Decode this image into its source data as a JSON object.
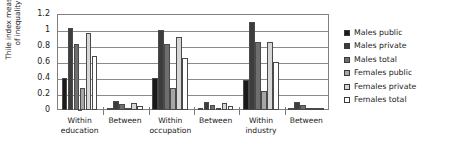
{
  "chart_data": {
    "type": "bar",
    "title": "",
    "xlabel": "",
    "ylabel": "Thile index measure\nof inequality",
    "ylim": [
      0,
      1.2
    ],
    "ytick_labels": [
      "1.2",
      "1",
      "0.8",
      "0.6",
      "0.4",
      "0.2",
      "0"
    ],
    "ytick_values": [
      1.2,
      1,
      0.8,
      0.6,
      0.4,
      0.2,
      0
    ],
    "grid": true,
    "legend_position": "right",
    "categories": [
      "Within\neducation",
      "Between",
      "Within\noccupation",
      "Between",
      "Within\nindustry",
      "Between"
    ],
    "series": [
      {
        "name": "Males public",
        "color": "#1a1a1a",
        "values": [
          0.4,
          0.03,
          0.4,
          0.03,
          0.38,
          0.02
        ]
      },
      {
        "name": "Males private",
        "color": "#3d3d3d",
        "values": [
          1.02,
          0.11,
          1.0,
          0.1,
          1.1,
          0.1
        ]
      },
      {
        "name": "Males total",
        "color": "#6e6e6e",
        "values": [
          0.83,
          0.07,
          0.82,
          0.06,
          0.85,
          0.06
        ]
      },
      {
        "name": "Females public",
        "color": "#a6a6a6",
        "values": [
          0.27,
          0.02,
          0.27,
          0.02,
          0.24,
          0.01
        ]
      },
      {
        "name": "Females private",
        "color": "#d6d6d6",
        "values": [
          0.96,
          0.09,
          0.91,
          0.09,
          0.85,
          0.02
        ]
      },
      {
        "name": "Females total",
        "color": "#ffffff",
        "values": [
          0.67,
          0.05,
          0.65,
          0.05,
          0.6,
          0.02
        ]
      }
    ]
  },
  "legend": {
    "items": [
      {
        "label": "Males public",
        "color": "#1a1a1a"
      },
      {
        "label": "Males private",
        "color": "#3d3d3d"
      },
      {
        "label": "Males total",
        "color": "#6e6e6e"
      },
      {
        "label": "Females public",
        "color": "#a6a6a6"
      },
      {
        "label": "Females private",
        "color": "#d6d6d6"
      },
      {
        "label": "Females total",
        "color": "#ffffff"
      }
    ]
  },
  "axis": {
    "y_title": "Thile index measure\nof inequality"
  }
}
